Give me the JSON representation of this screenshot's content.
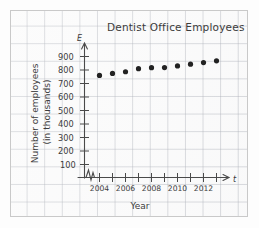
{
  "chart_data": {
    "type": "scatter",
    "title": "Dentist Office Employees",
    "xlabel": "Year",
    "ylabel": "Number of employees (in thousands)",
    "x_axis_symbol": "t",
    "y_axis_symbol": "E",
    "x": [
      2004,
      2005,
      2006,
      2007,
      2008,
      2009,
      2010,
      2011,
      2012,
      2013
    ],
    "values": [
      760,
      775,
      787,
      810,
      817,
      818,
      830,
      843,
      855,
      868
    ],
    "x_tick_labels": [
      "2004",
      "2006",
      "2008",
      "2010",
      "2012"
    ],
    "y_tick_labels": [
      "900",
      "800",
      "700",
      "600",
      "500",
      "400",
      "300",
      "200",
      "100"
    ],
    "ylim": [
      0,
      950
    ],
    "xlim": [
      2003.3,
      2014.2
    ],
    "grid": true,
    "legend": "none",
    "axis_break": true,
    "marker": "filled-circle"
  },
  "page": {
    "background_name": "graph-paper"
  }
}
